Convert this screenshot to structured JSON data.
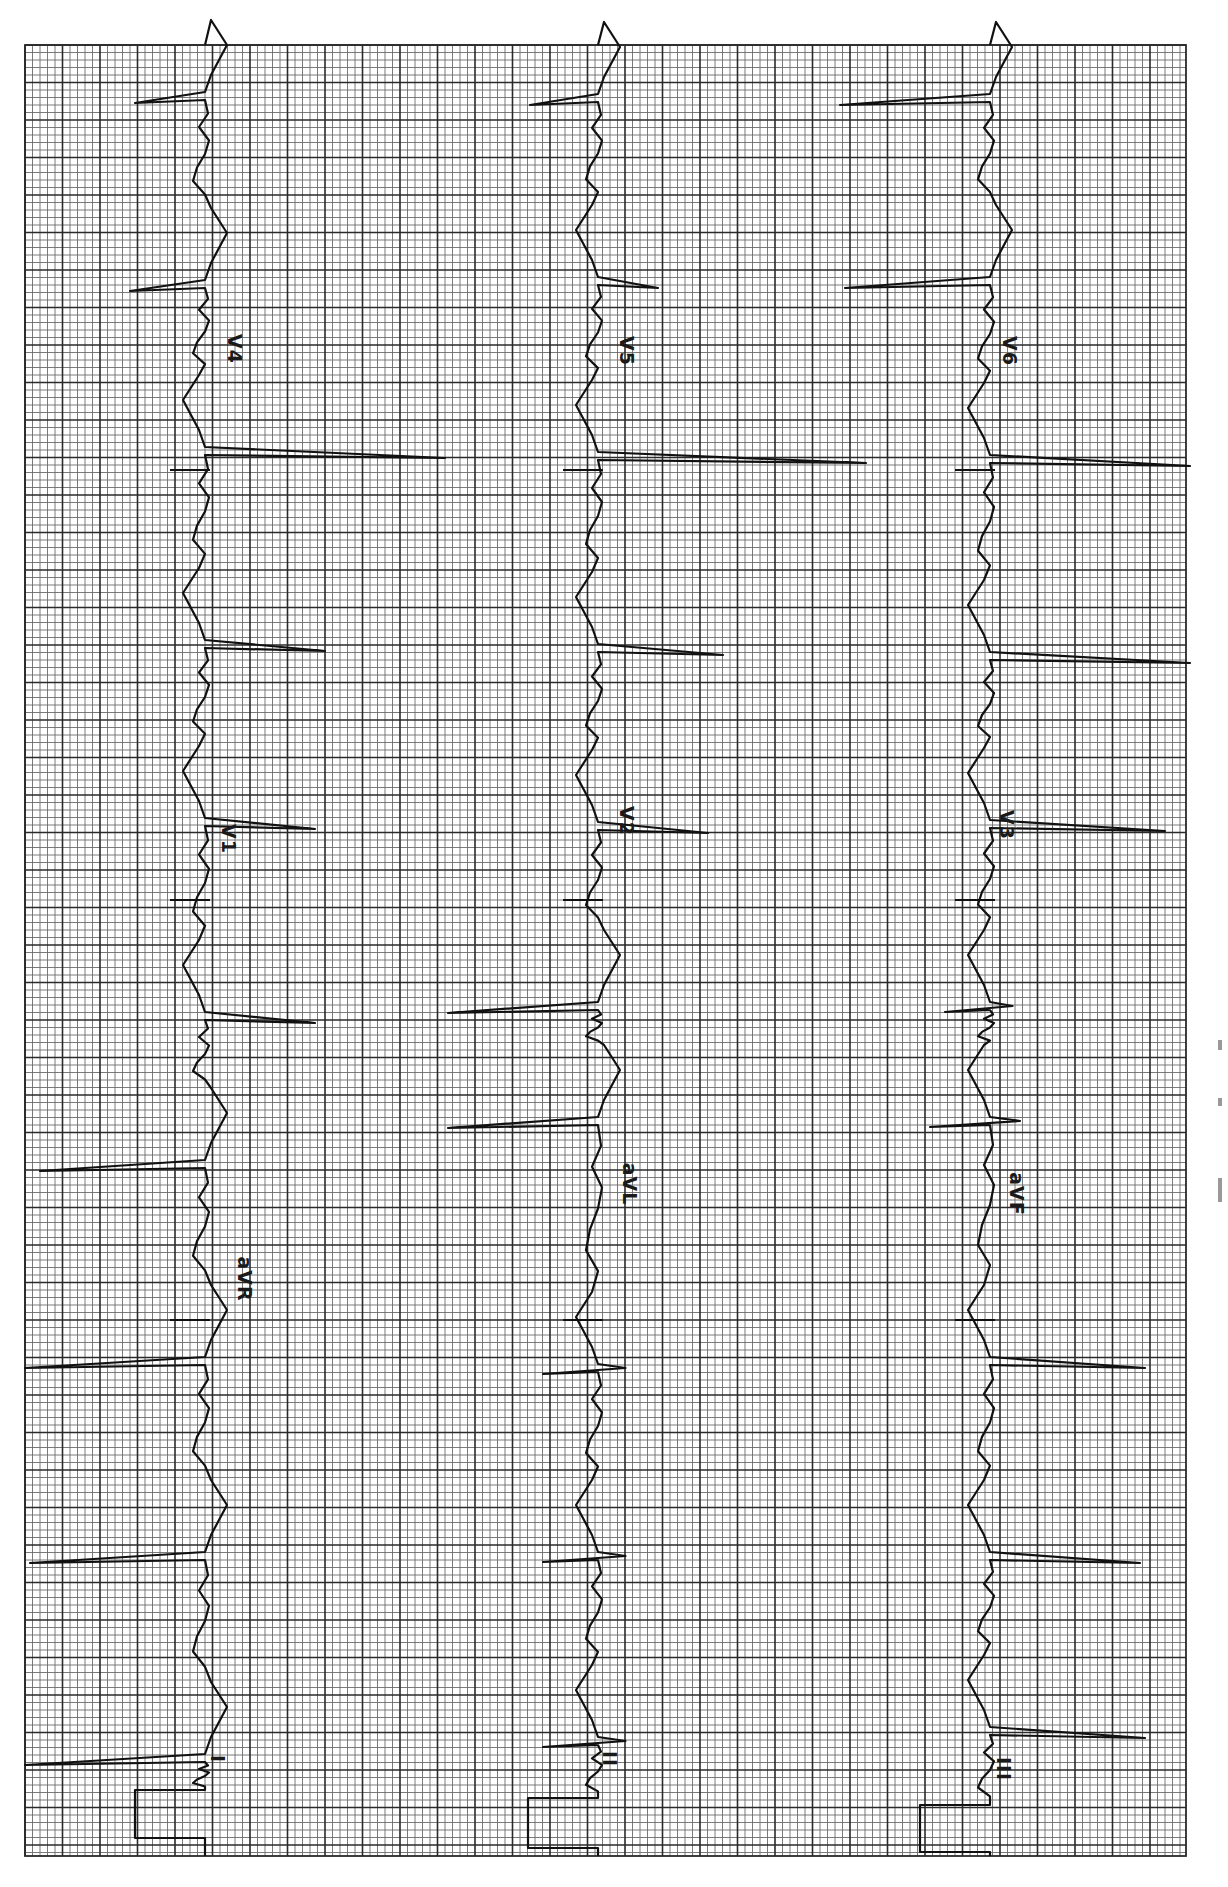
{
  "document": {
    "type": "12-lead electrocardiogram strip (rotated 90° clockwise)",
    "orientation": "time runs bottom-to-top; amplitude is horizontal"
  },
  "grid": {
    "x0": 25,
    "x1": 1186,
    "y0": 45,
    "y1": 1856,
    "minor_px": 7.5,
    "major_every": 5,
    "minor_color": "#6b6b6b",
    "major_color": "#2a2a2a",
    "paper_color": "#ffffff",
    "trace_color": "#111111"
  },
  "columns": [
    {
      "baseline_x": 205,
      "calibration": {
        "y_top": 1790,
        "y_bottom": 1838,
        "x_offset": -70
      },
      "leads": [
        {
          "name": "I",
          "label": "I",
          "label_x": 232,
          "label_y": 1760,
          "y_start": 1856,
          "y_end": 1320
        },
        {
          "name": "aVR",
          "label": "aVR",
          "label_x": 240,
          "label_y": 1280,
          "y_start": 1320,
          "y_end": 900
        },
        {
          "name": "V1",
          "label": "V1",
          "label_x": 232,
          "label_y": 840,
          "y_start": 900,
          "y_end": 470
        },
        {
          "name": "V4",
          "label": "V4",
          "label_x": 238,
          "label_y": 350,
          "y_start": 470,
          "y_end": 45
        }
      ],
      "qrs": [
        {
          "y": 1762,
          "dx": -180,
          "shape": "neg"
        },
        {
          "y": 1560,
          "dx": -175,
          "shape": "neg"
        },
        {
          "y": 1365,
          "dx": -180,
          "shape": "neg"
        },
        {
          "y": 1168,
          "dx": -165,
          "shape": "neg"
        },
        {
          "y": 1020,
          "dx": 110,
          "shape": "pos"
        },
        {
          "y": 826,
          "dx": 110,
          "shape": "pos"
        },
        {
          "y": 648,
          "dx": 120,
          "shape": "pos"
        },
        {
          "y": 455,
          "dx": 240,
          "shape": "pos"
        },
        {
          "y": 288,
          "dx": -75,
          "shape": "neg"
        },
        {
          "y": 100,
          "dx": -70,
          "shape": "neg"
        }
      ]
    },
    {
      "baseline_x": 598,
      "calibration": {
        "y_top": 1798,
        "y_bottom": 1848,
        "x_offset": -70
      },
      "leads": [
        {
          "name": "II",
          "label": "II",
          "label_x": 620,
          "label_y": 1760,
          "y_start": 1856,
          "y_end": 1320
        },
        {
          "name": "aVL",
          "label": "aVL",
          "label_x": 627,
          "label_y": 1185,
          "y_start": 1320,
          "y_end": 900
        },
        {
          "name": "V2",
          "label": "V2",
          "label_x": 630,
          "label_y": 822,
          "y_start": 900,
          "y_end": 470
        },
        {
          "name": "V5",
          "label": "V5",
          "label_x": 630,
          "label_y": 352,
          "y_start": 470,
          "y_end": 45
        }
      ],
      "qrs": [
        {
          "y": 1745,
          "dx": -55,
          "shape": "biphasic"
        },
        {
          "y": 1560,
          "dx": -55,
          "shape": "biphasic"
        },
        {
          "y": 1372,
          "dx": -55,
          "shape": "biphasic"
        },
        {
          "y": 1125,
          "dx": -150,
          "shape": "neg"
        },
        {
          "y": 1010,
          "dx": -150,
          "shape": "neg"
        },
        {
          "y": 830,
          "dx": 110,
          "shape": "pos"
        },
        {
          "y": 652,
          "dx": 125,
          "shape": "pos"
        },
        {
          "y": 460,
          "dx": 268,
          "shape": "pos"
        },
        {
          "y": 285,
          "dx": 60,
          "shape": "pos"
        },
        {
          "y": 102,
          "dx": -68,
          "shape": "neg"
        }
      ]
    },
    {
      "baseline_x": 990,
      "calibration": {
        "y_top": 1805,
        "y_bottom": 1852,
        "x_offset": -70
      },
      "leads": [
        {
          "name": "III",
          "label": "III",
          "label_x": 1010,
          "label_y": 1770,
          "y_start": 1856,
          "y_end": 1320
        },
        {
          "name": "aVF",
          "label": "aVF",
          "label_x": 1013,
          "label_y": 1195,
          "y_start": 1320,
          "y_end": 900
        },
        {
          "name": "V3",
          "label": "V3",
          "label_x": 1010,
          "label_y": 826,
          "y_start": 900,
          "y_end": 470
        },
        {
          "name": "V6",
          "label": "V6",
          "label_x": 1013,
          "label_y": 352,
          "y_start": 470,
          "y_end": 45
        }
      ],
      "qrs": [
        {
          "y": 1735,
          "dx": 155,
          "shape": "pos"
        },
        {
          "y": 1560,
          "dx": 150,
          "shape": "pos"
        },
        {
          "y": 1365,
          "dx": 155,
          "shape": "pos"
        },
        {
          "y": 1125,
          "dx": -60,
          "shape": "biphasic"
        },
        {
          "y": 1010,
          "dx": -45,
          "shape": "biphasic"
        },
        {
          "y": 828,
          "dx": 175,
          "shape": "pos"
        },
        {
          "y": 660,
          "dx": 200,
          "shape": "pos"
        },
        {
          "y": 463,
          "dx": 200,
          "shape": "pos"
        },
        {
          "y": 285,
          "dx": -145,
          "shape": "neg"
        },
        {
          "y": 102,
          "dx": -150,
          "shape": "neg"
        }
      ]
    }
  ],
  "margin_marks": [
    {
      "y": 1040,
      "h": 10
    },
    {
      "y": 1098,
      "h": 8
    },
    {
      "y": 1178,
      "h": 24
    }
  ]
}
